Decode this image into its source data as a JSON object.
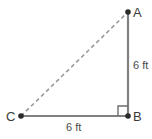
{
  "figure": {
    "type": "right-triangle-diagram",
    "canvas": {
      "width": 152,
      "height": 139,
      "background": "#ffffff"
    },
    "colors": {
      "solid_leg": "#808080",
      "dashed_hypotenuse": "#9a9a9a",
      "vertex_dot": "#2b2b2b",
      "label_text": "#3a3a3a",
      "measure_text": "#4a4a4a",
      "right_angle_marker": "#6e6e6e"
    },
    "vertices": [
      {
        "name": "A",
        "label": "A",
        "x": 128,
        "y": 12
      },
      {
        "name": "B",
        "label": "B",
        "x": 128,
        "y": 116
      },
      {
        "name": "C",
        "label": "C",
        "x": 21,
        "y": 116
      }
    ],
    "segments": [
      {
        "name": "AB",
        "from": "A",
        "to": "B",
        "style": "solid",
        "measure": "6 ft"
      },
      {
        "name": "CB",
        "from": "C",
        "to": "B",
        "style": "solid",
        "measure": "6 ft"
      },
      {
        "name": "CA",
        "from": "C",
        "to": "A",
        "style": "dashed",
        "measure": ""
      }
    ],
    "right_angle": {
      "at": "B",
      "size": 9
    },
    "labels": {
      "vertex_a": "A",
      "vertex_b": "B",
      "vertex_c": "C",
      "side_ab_measure": "6 ft",
      "side_cb_measure": "6 ft"
    }
  }
}
